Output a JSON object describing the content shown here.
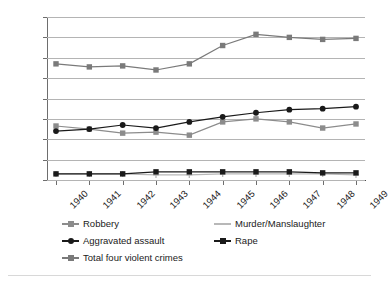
{
  "chart_data": {
    "type": "line",
    "title": "",
    "subtitle": "",
    "xlabel": "",
    "ylabel": "",
    "xlim": [
      1940,
      1949
    ],
    "ylim": [
      0,
      160
    ],
    "ytick_step": 20,
    "grid": true,
    "legend_position": "bottom",
    "categories": [
      "1940",
      "1941",
      "1942",
      "1943",
      "1944",
      "1945",
      "1946",
      "1947",
      "1948",
      "1949"
    ],
    "yticks": [
      "0",
      "20",
      "40",
      "60",
      "80",
      "100",
      "120",
      "140",
      "160"
    ],
    "series": [
      {
        "name": "Robbery",
        "marker": "square",
        "color": "#8c8c8c",
        "values": [
          53,
          50,
          46,
          47,
          44,
          57,
          60,
          57,
          51,
          55
        ]
      },
      {
        "name": "Murder/Manslaughter",
        "marker": "plus",
        "color": "#b8b8b8",
        "values": [
          6,
          6,
          6,
          5,
          5,
          6,
          6,
          6,
          6,
          5
        ]
      },
      {
        "name": "Aggravated assault",
        "marker": "circle",
        "color": "#1a1a1a",
        "values": [
          48,
          50,
          54,
          51,
          57,
          62,
          66,
          69,
          70,
          72
        ]
      },
      {
        "name": "Rape",
        "marker": "square",
        "color": "#1a1a1a",
        "values": [
          6,
          6,
          6,
          8,
          8,
          8,
          8,
          8,
          7,
          7
        ]
      },
      {
        "name": "Total four violent crimes",
        "marker": "square",
        "color": "#7a7a7a",
        "values": [
          114,
          111,
          112,
          108,
          114,
          132,
          143,
          140,
          138,
          139
        ]
      }
    ]
  },
  "legend": {
    "items": [
      {
        "label": "Robbery"
      },
      {
        "label": "Murder/Manslaughter"
      },
      {
        "label": "Aggravated assault"
      },
      {
        "label": "Rape"
      },
      {
        "label": "Total four violent crimes"
      }
    ]
  }
}
